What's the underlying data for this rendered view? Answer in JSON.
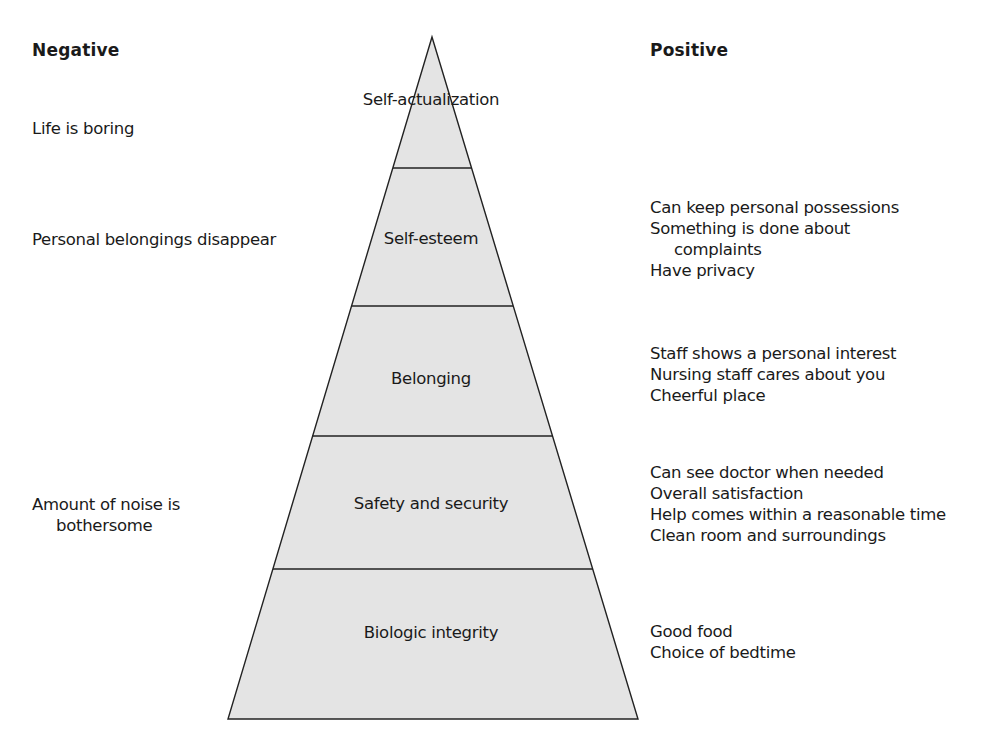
{
  "headers": {
    "negative": "Negative",
    "positive": "Positive"
  },
  "pyramid": {
    "fill_color": "#e4e4e4",
    "stroke_color": "#222222",
    "tiers": [
      {
        "label": "Self-actualization"
      },
      {
        "label": "Self-esteem"
      },
      {
        "label": "Belonging"
      },
      {
        "label": "Safety and security"
      },
      {
        "label": "Biologic integrity"
      }
    ]
  },
  "negative": {
    "self_actualization": [
      "Life is boring"
    ],
    "self_esteem": [
      "Personal belongings disappear"
    ],
    "safety": [
      "Amount of noise is",
      "bothersome"
    ]
  },
  "positive": {
    "self_esteem": [
      "Can keep personal possessions",
      "Something is done about",
      "complaints",
      "Have privacy"
    ],
    "belonging": [
      "Staff shows a personal interest",
      "Nursing staff cares about you",
      "Cheerful place"
    ],
    "safety": [
      "Can see doctor when needed",
      "Overall satisfaction",
      "Help comes within a reasonable time",
      "Clean room and surroundings"
    ],
    "biologic": [
      "Good food",
      "Choice of bedtime"
    ]
  }
}
